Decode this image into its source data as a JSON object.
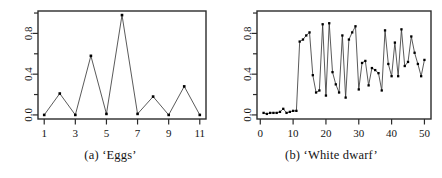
{
  "figure": {
    "background_color": "#ffffff",
    "line_color": "#3c3c3c",
    "point_color": "#000000",
    "axis_color": "#2b2b2b"
  },
  "panels": [
    {
      "id": "panel-a",
      "caption": "(a) ‘Eggs’",
      "chart_data": {
        "type": "line",
        "title": "(a) ‘Eggs’",
        "xlabel": "",
        "ylabel": "",
        "x": [
          1,
          2,
          3,
          4,
          5,
          6,
          7,
          8,
          9,
          10,
          11
        ],
        "values": [
          0.0,
          0.21,
          0.0,
          0.58,
          0.01,
          0.98,
          0.01,
          0.18,
          0.0,
          0.28,
          0.0
        ],
        "series": [
          {
            "name": "Eggs",
            "values": [
              0.0,
              0.21,
              0.0,
              0.58,
              0.01,
              0.98,
              0.01,
              0.18,
              0.0,
              0.28,
              0.0
            ]
          }
        ],
        "xticks": [
          1,
          3,
          5,
          7,
          9,
          11
        ],
        "xtick_labels": [
          "1",
          "3",
          "5",
          "7",
          "9",
          "11"
        ],
        "yticks": [
          0.0,
          0.4,
          0.8
        ],
        "ytick_labels": [
          "0.0",
          "0.4",
          "0.8"
        ],
        "yminorticks": [
          0.2,
          0.6,
          1.0
        ],
        "xlim": [
          0.6,
          11.4
        ],
        "ylim": [
          -0.04,
          1.02
        ],
        "grid": false,
        "legend": "none",
        "marker": "filled-square"
      }
    },
    {
      "id": "panel-b",
      "caption": "(b) ‘White dwarf’",
      "chart_data": {
        "type": "line",
        "title": "(b) ‘White dwarf’",
        "xlabel": "",
        "ylabel": "",
        "x": [
          1,
          2,
          3,
          4,
          5,
          6,
          7,
          8,
          9,
          10,
          11,
          12,
          13,
          14,
          15,
          16,
          17,
          18,
          19,
          20,
          21,
          22,
          23,
          24,
          25,
          26,
          27,
          28,
          29,
          30,
          31,
          32,
          33,
          34,
          35,
          36,
          37,
          38,
          39,
          40,
          41,
          42,
          43,
          44,
          45,
          46,
          47,
          48,
          49,
          50
        ],
        "values": [
          0.02,
          0.01,
          0.02,
          0.02,
          0.02,
          0.03,
          0.06,
          0.02,
          0.03,
          0.04,
          0.04,
          0.72,
          0.74,
          0.78,
          0.81,
          0.39,
          0.22,
          0.24,
          0.89,
          0.19,
          0.9,
          0.42,
          0.3,
          0.22,
          0.78,
          0.17,
          0.74,
          0.81,
          0.87,
          0.25,
          0.51,
          0.53,
          0.29,
          0.46,
          0.44,
          0.41,
          0.24,
          0.83,
          0.5,
          0.38,
          0.71,
          0.38,
          0.84,
          0.48,
          0.52,
          0.77,
          0.61,
          0.5,
          0.38,
          0.54
        ],
        "series": [
          {
            "name": "White dwarf",
            "values": [
              0.02,
              0.01,
              0.02,
              0.02,
              0.02,
              0.03,
              0.06,
              0.02,
              0.03,
              0.04,
              0.04,
              0.72,
              0.74,
              0.78,
              0.81,
              0.39,
              0.22,
              0.24,
              0.89,
              0.19,
              0.9,
              0.42,
              0.3,
              0.22,
              0.78,
              0.17,
              0.74,
              0.81,
              0.87,
              0.25,
              0.51,
              0.53,
              0.29,
              0.46,
              0.44,
              0.41,
              0.24,
              0.83,
              0.5,
              0.38,
              0.71,
              0.38,
              0.84,
              0.48,
              0.52,
              0.77,
              0.61,
              0.5,
              0.38,
              0.54
            ]
          }
        ],
        "xticks": [
          0,
          10,
          20,
          30,
          40,
          50
        ],
        "xtick_labels": [
          "0",
          "10",
          "20",
          "30",
          "40",
          "50"
        ],
        "yticks": [
          0.0,
          0.4,
          0.8
        ],
        "ytick_labels": [
          "0.0",
          "0.4",
          "0.8"
        ],
        "yminorticks": [
          0.2,
          0.6,
          1.0
        ],
        "xlim": [
          -1.0,
          52.0
        ],
        "ylim": [
          -0.04,
          1.02
        ],
        "grid": false,
        "legend": "none",
        "marker": "filled-square"
      }
    }
  ]
}
